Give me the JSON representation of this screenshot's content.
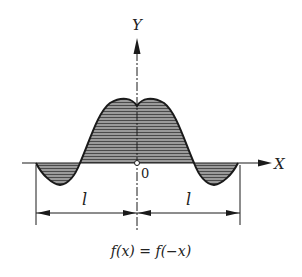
{
  "diagram": {
    "axis_y_label": "Y",
    "axis_x_label": "X",
    "origin_label": "0",
    "dimension_left_label": "l",
    "dimension_right_label": "l",
    "caption": "f(x) = f(−x)",
    "colors": {
      "stroke": "#1a1a1a",
      "fill_hatch": "#7a7a7a",
      "background": "#ffffff"
    }
  }
}
